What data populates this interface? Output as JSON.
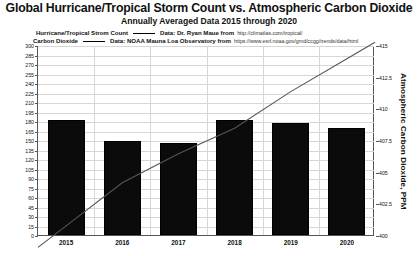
{
  "title": "Global Hurricane/Tropical Storm Count vs. Atmospheric Carbon Dioxide",
  "subtitle": "Annually Averaged Data 2015 through 2020",
  "legend": {
    "rows": [
      {
        "name": "Hurricane/Tropical Strom Count",
        "data_label": "Data: Dr. Ryan Maue from",
        "url": "http://climatlas.com/tropical/"
      },
      {
        "name": "Carbon Dioxide",
        "data_label": "Data: NOAA Mauna Loa Observatory from",
        "url": "https://www.esrl.noaa.gov/gmd/ccgg/trends/data/html"
      }
    ]
  },
  "axes": {
    "left_ticks": [
      "300",
      "285",
      "270",
      "255",
      "240",
      "225",
      "210",
      "195",
      "180",
      "165",
      "150",
      "135",
      "120",
      "105",
      "90",
      "75",
      "60",
      "45",
      "30",
      "15",
      "0"
    ],
    "right_ticks": [
      "415",
      "412.5",
      "410",
      "407.5",
      "405",
      "402.5",
      "400"
    ],
    "right_title": "Atmospheric Carbon Dioxide, PPM",
    "left_title": "",
    "x_labels": [
      "2015",
      "2016",
      "2017",
      "2018",
      "2019",
      "2020"
    ]
  },
  "colors": {
    "bar": "#0b0b0b",
    "line": "#555555",
    "grid": "#d6d6d6",
    "axis": "#555555"
  },
  "chart_data": {
    "type": "bar",
    "title": "Global Hurricane/Tropical Storm Count vs. Atmospheric Carbon Dioxide",
    "subtitle": "Annually Averaged Data 2015 through 2020",
    "categories": [
      "2015",
      "2016",
      "2017",
      "2018",
      "2019",
      "2020"
    ],
    "xlabel": "",
    "ylabel": "",
    "ylim": [
      0,
      300
    ],
    "ytick_step": 15,
    "grid": true,
    "legend_position": "top",
    "series": [
      {
        "name": "Hurricane/Tropical Strom Count",
        "type": "bar",
        "axis": "left",
        "values": [
          182,
          149,
          145,
          182,
          177,
          169
        ]
      },
      {
        "name": "Carbon Dioxide",
        "type": "line",
        "axis": "right",
        "unit": "PPM",
        "ylim": [
          400,
          415
        ],
        "values": [
          400.8,
          404.2,
          406.5,
          408.5,
          411.4,
          414.0
        ]
      }
    ]
  }
}
